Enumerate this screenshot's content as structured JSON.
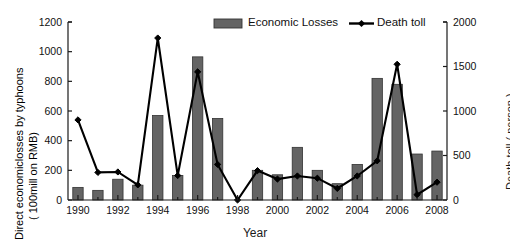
{
  "chart_data": {
    "type": "bar",
    "title": "",
    "xlabel": "Year",
    "ylabel": "Direct economiclosses by typhoons ( 100mill on RMB)",
    "ylabel_line1": "Direct economiclosses by typhoons",
    "ylabel_line2": "( 100mill on RMB)",
    "y2label": "Death toll ( person )",
    "categories": [
      1990,
      1991,
      1992,
      1993,
      1994,
      1995,
      1996,
      1997,
      1998,
      1999,
      2000,
      2001,
      2002,
      2003,
      2004,
      2005,
      2006,
      2007,
      2008
    ],
    "xtick_labels": [
      "1990",
      "1992",
      "1994",
      "1996",
      "1998",
      "2000",
      "2002",
      "2004",
      "2006",
      "2008"
    ],
    "xtick_values": [
      1990,
      1992,
      1994,
      1996,
      1998,
      2000,
      2002,
      2004,
      2006,
      2008
    ],
    "ylim": [
      0,
      1200
    ],
    "ytick_labels": [
      "0",
      "200",
      "400",
      "600",
      "800",
      "1000",
      "1200"
    ],
    "ytick_values": [
      0,
      200,
      400,
      600,
      800,
      1000,
      1200
    ],
    "y2lim": [
      0,
      2000
    ],
    "y2tick_labels": [
      "0",
      "500",
      "1000",
      "1500",
      "2000"
    ],
    "y2tick_values": [
      0,
      500,
      1000,
      1500,
      2000
    ],
    "grid": false,
    "legend_position": "top-center",
    "series": [
      {
        "name": "Economic Losses",
        "kind": "bar",
        "axis": "left",
        "color": "#646464",
        "values": [
          85,
          65,
          140,
          100,
          570,
          165,
          965,
          550,
          0,
          200,
          170,
          355,
          200,
          110,
          240,
          820,
          780,
          310,
          330
        ]
      },
      {
        "name": "Death toll",
        "kind": "line",
        "axis": "right",
        "color": "#000000",
        "marker": "diamond",
        "values": [
          900,
          310,
          315,
          170,
          1820,
          275,
          1440,
          400,
          0,
          330,
          235,
          270,
          245,
          130,
          270,
          440,
          1525,
          60,
          200
        ]
      }
    ]
  },
  "legend": {
    "items": [
      {
        "label": "Economic Losses",
        "type": "bar-swatch"
      },
      {
        "label": "Death toll",
        "type": "line-marker"
      }
    ]
  },
  "colors": {
    "bar_fill": "#646464",
    "bar_stroke": "#333333",
    "line": "#000000",
    "axis": "#1a1a1a",
    "background": "#ffffff"
  }
}
